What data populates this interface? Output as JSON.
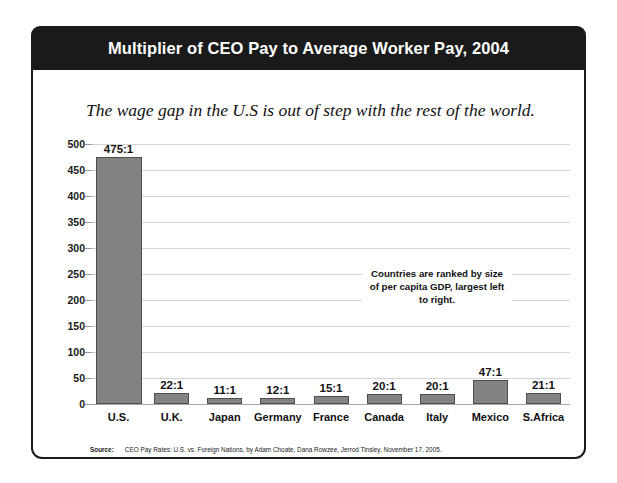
{
  "header": {
    "title": "Multiplier of CEO Pay to Average Worker Pay, 2004"
  },
  "subtitle": "The wage gap in the U.S is out of step with the rest of the world.",
  "annotation": "Countries are ranked by size of per capita GDP, largest left to right.",
  "source": {
    "label": "Source:",
    "text": "CEO Pay Rates: U.S. vs. Foreign Nations, by Adam Choate, Dana Rowzee, Jerrod Tinsley, November 17, 2005."
  },
  "colors": {
    "banner": "#1a1a1a",
    "bar_fill": "#838383",
    "bar_stroke": "#4d4d4d",
    "gridline": "#d2d2d2",
    "text": "#111111"
  },
  "chart_data": {
    "type": "bar",
    "title": "Multiplier of CEO Pay to Average Worker Pay, 2004",
    "subtitle": "The wage gap in the U.S is out of step with the rest of the world.",
    "xlabel": "",
    "ylabel": "",
    "ylim": [
      0,
      500
    ],
    "yticks": [
      0,
      50,
      100,
      150,
      200,
      250,
      300,
      350,
      400,
      450,
      500
    ],
    "ytick_labels": [
      "0",
      "50",
      "100",
      "150",
      "200",
      "250",
      "300",
      "350",
      "400",
      "450",
      "500"
    ],
    "grid": true,
    "legend": false,
    "categories": [
      "U.S.",
      "U.K.",
      "Japan",
      "Germany",
      "France",
      "Canada",
      "Italy",
      "Mexico",
      "S.Africa"
    ],
    "values": [
      475,
      22,
      11,
      12,
      15,
      20,
      20,
      47,
      21
    ],
    "data_labels": [
      "475:1",
      "22:1",
      "11:1",
      "12:1",
      "15:1",
      "20:1",
      "20:1",
      "47:1",
      "21:1"
    ],
    "annotations": [
      "Countries are ranked by size of per capita GDP, largest left to right."
    ]
  }
}
